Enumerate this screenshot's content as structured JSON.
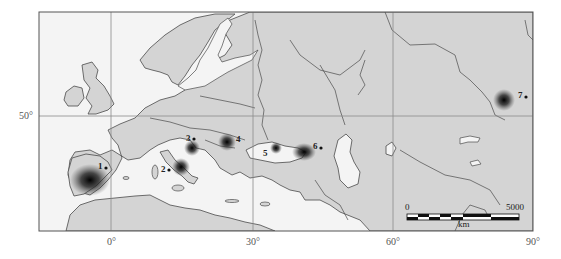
{
  "map": {
    "title": "",
    "longitude_labels": [
      "0°",
      "30°",
      "60°",
      "90°"
    ],
    "latitude_labels": [
      "50°"
    ],
    "colors": {
      "land": "#d4d4d4",
      "sea": "#f4f4f4",
      "border": "#4a4a4a",
      "grid": "#8a8a8a",
      "hotspot": "#111111"
    },
    "sites": [
      {
        "id": "1",
        "label": "1"
      },
      {
        "id": "2",
        "label": "2"
      },
      {
        "id": "3",
        "label": "3"
      },
      {
        "id": "4",
        "label": "4"
      },
      {
        "id": "5",
        "label": "5"
      },
      {
        "id": "6",
        "label": "6"
      },
      {
        "id": "7",
        "label": "7"
      }
    ],
    "scale_bar": {
      "start": "0",
      "end": "5000",
      "unit": "km"
    }
  }
}
